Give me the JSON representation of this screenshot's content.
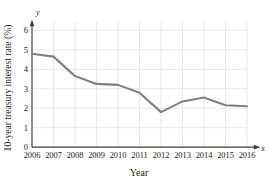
{
  "chart_data": {
    "type": "line",
    "title": "",
    "xlabel": "Year",
    "ylabel": "10-year treasury interest rate (%)",
    "x_axis_symbol": "x",
    "y_axis_symbol": "y",
    "categories": [
      "2006",
      "2007",
      "2008",
      "2009",
      "2010",
      "2011",
      "2012",
      "2013",
      "2014",
      "2015",
      "2016"
    ],
    "values": [
      4.8,
      4.65,
      3.65,
      3.25,
      3.2,
      2.8,
      1.8,
      2.35,
      2.55,
      2.15,
      2.1
    ],
    "y_ticks": [
      "0",
      "1",
      "2",
      "3",
      "4",
      "5",
      "6"
    ],
    "y_tick_values": [
      0,
      1,
      2,
      3,
      4,
      5,
      6
    ],
    "ylim": [
      0,
      6.5
    ],
    "xlim": [
      2006,
      2016
    ],
    "grid": true,
    "legend": "none",
    "series_color": "#808080",
    "grid_color": "#dcdcdc",
    "axis_color": "#3c3c3c"
  }
}
